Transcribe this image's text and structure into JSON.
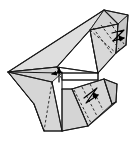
{
  "figure": {
    "type": "geometric-line-drawing",
    "canvas": {
      "width": 131,
      "height": 141
    },
    "colors": {
      "background": "#ffffff",
      "face_light": "#dedede",
      "face_mid": "#d2d2d2",
      "face_dark": "#c6c6c6",
      "face_white": "#ffffff",
      "stroke": "#1a1a1a",
      "dashed_stroke": "#1a1a1a",
      "arrow": "#000000"
    },
    "stroke_widths": {
      "outline": 1.1,
      "interior": 0.9,
      "dashed": 0.9,
      "arrow": 1.2
    },
    "faces": [
      {
        "name": "left-large-wing-upper",
        "fill": "#dedede",
        "points": "8,72 104,10 90,30 57,67"
      },
      {
        "name": "left-large-wing-lower",
        "fill": "#d2d2d2",
        "points": "8,72 57,67 62,73 52,82 44,131 34,104"
      },
      {
        "name": "left-wing-bottom-fan",
        "fill": "#d6d6d6",
        "points": "8,72 34,104 44,131 62,131 52,82"
      },
      {
        "name": "center-white-triangle",
        "fill": "#ffffff",
        "points": "57,67 90,30 98,73"
      },
      {
        "name": "upper-right-prism-top",
        "fill": "#d2d2d2",
        "points": "90,30 104,10 128,15 118,24"
      },
      {
        "name": "upper-right-prism-front",
        "fill": "#d8d8d8",
        "points": "90,30 118,24 116,53 98,73"
      },
      {
        "name": "upper-right-prism-side",
        "fill": "#c6c6c6",
        "points": "118,24 128,15 126,45 116,53"
      },
      {
        "name": "lower-right-prism-front",
        "fill": "#d8d8d8",
        "points": "72,89 104,79 112,104 88,126"
      },
      {
        "name": "lower-right-prism-side",
        "fill": "#c8c8c8",
        "points": "104,79 117,84 116,102 112,104"
      },
      {
        "name": "lower-center-flap",
        "fill": "#d4d4d4",
        "points": "62,89 72,89 88,126 62,131"
      },
      {
        "name": "mid-connector-band",
        "fill": "#ffffff",
        "points": "62,73 98,73 98,80 62,80"
      }
    ],
    "solid_lines": [
      {
        "name": "top-long-edge",
        "x1": 8,
        "y1": 72,
        "x2": 104,
        "y2": 10
      },
      {
        "name": "apex-to-top-right",
        "x1": 104,
        "y1": 10,
        "x2": 128,
        "y2": 15
      },
      {
        "name": "right-outer-edge",
        "x1": 128,
        "y1": 15,
        "x2": 126,
        "y2": 45
      },
      {
        "name": "right-lower-edge",
        "x1": 126,
        "y1": 45,
        "x2": 116,
        "y2": 53
      },
      {
        "name": "prism-bottom-edge",
        "x1": 116,
        "y1": 53,
        "x2": 98,
        "y2": 73
      },
      {
        "name": "prism-ridge",
        "x1": 104,
        "y1": 10,
        "x2": 118,
        "y2": 24
      },
      {
        "name": "prism-ridge-down",
        "x1": 118,
        "y1": 24,
        "x2": 116,
        "y2": 53
      },
      {
        "name": "prism-left-fold",
        "x1": 90,
        "y1": 30,
        "x2": 118,
        "y2": 24
      },
      {
        "name": "center-fold-a",
        "x1": 90,
        "y1": 30,
        "x2": 57,
        "y2": 67
      },
      {
        "name": "center-fold-b",
        "x1": 90,
        "y1": 30,
        "x2": 98,
        "y2": 73
      },
      {
        "name": "center-base",
        "x1": 57,
        "y1": 67,
        "x2": 98,
        "y2": 73
      },
      {
        "name": "left-fan-1",
        "x1": 8,
        "y1": 72,
        "x2": 57,
        "y2": 67
      },
      {
        "name": "left-fan-2",
        "x1": 8,
        "y1": 72,
        "x2": 62,
        "y2": 73
      },
      {
        "name": "left-fan-3",
        "x1": 8,
        "y1": 72,
        "x2": 52,
        "y2": 82
      },
      {
        "name": "left-fan-4",
        "x1": 8,
        "y1": 72,
        "x2": 34,
        "y2": 104
      },
      {
        "name": "left-outer-lower",
        "x1": 34,
        "y1": 104,
        "x2": 44,
        "y2": 131
      },
      {
        "name": "left-base-edge",
        "x1": 44,
        "y1": 131,
        "x2": 62,
        "y2": 131
      },
      {
        "name": "left-inner-vertical",
        "x1": 52,
        "y1": 82,
        "x2": 62,
        "y2": 131
      },
      {
        "name": "band-top",
        "x1": 62,
        "y1": 73,
        "x2": 98,
        "y2": 73
      },
      {
        "name": "band-bottom",
        "x1": 62,
        "y1": 80,
        "x2": 98,
        "y2": 80
      },
      {
        "name": "band-left",
        "x1": 62,
        "y1": 73,
        "x2": 62,
        "y2": 89
      },
      {
        "name": "band-right",
        "x1": 98,
        "y1": 73,
        "x2": 98,
        "y2": 80
      },
      {
        "name": "lower-prism-top",
        "x1": 72,
        "y1": 89,
        "x2": 104,
        "y2": 79
      },
      {
        "name": "lower-prism-top-right",
        "x1": 104,
        "y1": 79,
        "x2": 117,
        "y2": 84
      },
      {
        "name": "lower-prism-right",
        "x1": 117,
        "y1": 84,
        "x2": 116,
        "y2": 102
      },
      {
        "name": "lower-prism-right-low",
        "x1": 116,
        "y1": 102,
        "x2": 88,
        "y2": 126
      },
      {
        "name": "lower-prism-ridge",
        "x1": 104,
        "y1": 79,
        "x2": 112,
        "y2": 104
      },
      {
        "name": "lower-prism-ridge-b",
        "x1": 112,
        "y1": 104,
        "x2": 116,
        "y2": 102
      },
      {
        "name": "lower-left-fold",
        "x1": 72,
        "y1": 89,
        "x2": 88,
        "y2": 126
      },
      {
        "name": "lower-flap-left",
        "x1": 62,
        "y1": 89,
        "x2": 72,
        "y2": 89
      },
      {
        "name": "lower-flap-base",
        "x1": 62,
        "y1": 131,
        "x2": 88,
        "y2": 126
      },
      {
        "name": "lower-flap-diag",
        "x1": 62,
        "y1": 89,
        "x2": 62,
        "y2": 131
      }
    ],
    "dashed_lines": [
      {
        "name": "upper-crease-1",
        "x1": 93,
        "y1": 28,
        "x2": 113,
        "y2": 55
      },
      {
        "name": "upper-crease-2",
        "x1": 101,
        "y1": 25,
        "x2": 119,
        "y2": 49
      },
      {
        "name": "upper-crease-3",
        "x1": 110,
        "y1": 22,
        "x2": 124,
        "y2": 44
      },
      {
        "name": "upper-crease-4",
        "x1": 90,
        "y1": 30,
        "x2": 116,
        "y2": 53
      },
      {
        "name": "lower-crease-1",
        "x1": 74,
        "y1": 90,
        "x2": 91,
        "y2": 123
      },
      {
        "name": "lower-crease-2",
        "x1": 82,
        "y1": 87,
        "x2": 97,
        "y2": 116
      },
      {
        "name": "lower-crease-3",
        "x1": 90,
        "y1": 84,
        "x2": 103,
        "y2": 110
      },
      {
        "name": "left-crease-1",
        "x1": 52,
        "y1": 82,
        "x2": 44,
        "y2": 131
      },
      {
        "name": "band-crease",
        "x1": 57,
        "y1": 67,
        "x2": 62,
        "y2": 80
      }
    ],
    "arrows": [
      {
        "name": "fold-arrow-upper-right",
        "kind": "zigzag-double",
        "path": "M112,33 L124,30 L113,41 L124,38",
        "head_at": [
          124,
          30
        ],
        "head2_at": [
          124,
          38
        ]
      },
      {
        "name": "fold-arrow-lower-right",
        "kind": "zigzag-double",
        "path": "M84,98 L97,88 L86,103 L98,95",
        "head_at": [
          97,
          88
        ],
        "head2_at": [
          98,
          95
        ]
      },
      {
        "name": "fold-arrow-center-up",
        "kind": "straight-up",
        "path": "M59,82 L59,68",
        "head_at": [
          59,
          68
        ]
      },
      {
        "name": "fold-arrow-center-left",
        "kind": "short-left",
        "path": "M62,72 L52,74",
        "head_at": [
          52,
          74
        ]
      }
    ],
    "labels": []
  }
}
